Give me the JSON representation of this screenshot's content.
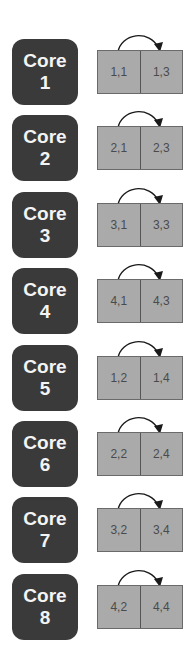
{
  "diagram": {
    "type": "core-to-cell-swap-mapping",
    "colors": {
      "core_fill": "#3a3a3a",
      "core_text": "#f4f4f4",
      "cell_fill": "#aaaaaa",
      "cell_border": "#6a6a6a",
      "cell_text": "#4a4a4a",
      "arrow": "#1a1a1a"
    },
    "rows": [
      {
        "core_label": "Core",
        "core_number": "1",
        "cells": [
          "1,1",
          "1,3"
        ],
        "arrow": "left-to-right"
      },
      {
        "core_label": "Core",
        "core_number": "2",
        "cells": [
          "2,1",
          "2,3"
        ],
        "arrow": "left-to-right"
      },
      {
        "core_label": "Core",
        "core_number": "3",
        "cells": [
          "3,1",
          "3,3"
        ],
        "arrow": "left-to-right"
      },
      {
        "core_label": "Core",
        "core_number": "4",
        "cells": [
          "4,1",
          "4,3"
        ],
        "arrow": "left-to-right"
      },
      {
        "core_label": "Core",
        "core_number": "5",
        "cells": [
          "1,2",
          "1,4"
        ],
        "arrow": "left-to-right"
      },
      {
        "core_label": "Core",
        "core_number": "6",
        "cells": [
          "2,2",
          "2,4"
        ],
        "arrow": "left-to-right"
      },
      {
        "core_label": "Core",
        "core_number": "7",
        "cells": [
          "3,2",
          "3,4"
        ],
        "arrow": "left-to-right"
      },
      {
        "core_label": "Core",
        "core_number": "8",
        "cells": [
          "4,2",
          "4,4"
        ],
        "arrow": "left-to-right"
      }
    ]
  }
}
